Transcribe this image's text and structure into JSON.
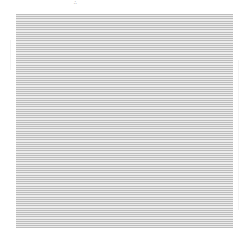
{
  "page": {
    "top_mark": "∴",
    "content_description": "dense ruled/text lines (illegible at this resolution)"
  },
  "colors": {
    "background": "#ffffff",
    "line": "#bdbdbd",
    "fill": "#ececec"
  }
}
